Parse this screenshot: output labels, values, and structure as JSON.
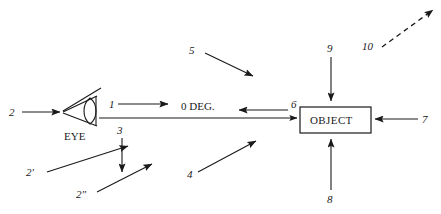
{
  "diagram": {
    "background_color": "#ffffff",
    "ink_color": "#1a1a1a",
    "width": 441,
    "height": 214,
    "texts": {
      "eye_label": "EYE",
      "angle_label": "0 DEG.",
      "object_label": "OBJECT"
    },
    "callouts": [
      {
        "id": "c1",
        "label": "1",
        "arrow": "right",
        "style": "solid",
        "note": "short arrow above sight line, leaving eye"
      },
      {
        "id": "c2",
        "label": "2",
        "arrow": "right",
        "style": "solid",
        "note": "arrow entering eye from far left"
      },
      {
        "id": "c2p",
        "label": "2'",
        "arrow": "up-right",
        "style": "solid",
        "note": "diagonal arrow toward eye region"
      },
      {
        "id": "c2pp",
        "label": "2\"",
        "arrow": "up-right",
        "style": "solid",
        "note": "lower diagonal arrow toward sight line"
      },
      {
        "id": "c3",
        "label": "3",
        "arrow": "down",
        "style": "solid",
        "note": "vertical arrow below sight line"
      },
      {
        "id": "c4",
        "label": "4",
        "arrow": "up-right",
        "style": "solid",
        "note": "diagonal arrow in lower middle"
      },
      {
        "id": "c5",
        "label": "5",
        "arrow": "down-right",
        "style": "solid",
        "note": "diagonal arrow in upper middle"
      },
      {
        "id": "c6",
        "label": "6",
        "arrow": "left",
        "style": "solid",
        "note": "arrow pointing left from object side"
      },
      {
        "id": "c7",
        "label": "7",
        "arrow": "left",
        "style": "solid",
        "note": "arrow entering object from right"
      },
      {
        "id": "c8",
        "label": "8",
        "arrow": "up",
        "style": "solid",
        "note": "vertical arrow entering object from below"
      },
      {
        "id": "c9",
        "label": "9",
        "arrow": "down",
        "style": "solid",
        "note": "vertical arrow entering object from above"
      },
      {
        "id": "c10",
        "label": "10",
        "arrow": "up-right",
        "style": "dashed",
        "note": "dashed diagonal arrow to upper right"
      }
    ]
  }
}
